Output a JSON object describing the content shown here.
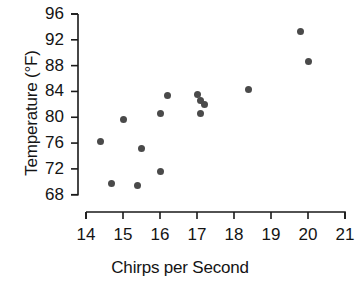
{
  "chart_data": {
    "type": "scatter",
    "title": "",
    "xlabel": "Chirps per Second",
    "ylabel": "Temperature (°F)",
    "xlim": [
      14,
      21
    ],
    "ylim": [
      68,
      96
    ],
    "xticks": [
      14,
      15,
      16,
      17,
      18,
      19,
      20,
      21
    ],
    "yticks": [
      68,
      72,
      76,
      80,
      84,
      88,
      92,
      96
    ],
    "xtick_labels": [
      "14",
      "15",
      "16",
      "17",
      "18",
      "19",
      "20",
      "21"
    ],
    "ytick_labels": [
      "68",
      "72",
      "76",
      "80",
      "84",
      "88",
      "92",
      "96"
    ],
    "grid": false,
    "legend": null,
    "marker": "filled-circle",
    "marker_color": "#4a4a4a",
    "points": [
      {
        "x": 14.4,
        "y": 76.3
      },
      {
        "x": 14.7,
        "y": 69.7
      },
      {
        "x": 15.0,
        "y": 79.6
      },
      {
        "x": 15.4,
        "y": 69.4
      },
      {
        "x": 15.5,
        "y": 75.2
      },
      {
        "x": 16.0,
        "y": 71.6
      },
      {
        "x": 16.0,
        "y": 80.6
      },
      {
        "x": 16.2,
        "y": 83.3
      },
      {
        "x": 17.0,
        "y": 83.5
      },
      {
        "x": 17.1,
        "y": 82.6
      },
      {
        "x": 17.2,
        "y": 82.0
      },
      {
        "x": 17.1,
        "y": 80.6
      },
      {
        "x": 18.4,
        "y": 84.3
      },
      {
        "x": 19.8,
        "y": 93.3
      },
      {
        "x": 20.0,
        "y": 88.6
      }
    ]
  },
  "axes": {
    "y_axis_name": "temperature-axis",
    "x_axis_name": "chirps-axis"
  }
}
